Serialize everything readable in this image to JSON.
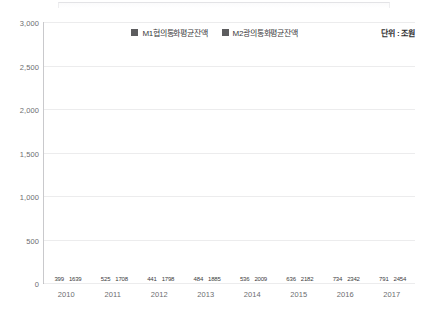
{
  "unit_note": "단위 : 조원",
  "legend": {
    "position": "top-center",
    "items": [
      {
        "label": "M1협의통화평균잔액",
        "color": "#5c5c5e",
        "swatch_icon": "square-swatch-icon"
      },
      {
        "label": "M2광의통화평균잔액",
        "color": "#5c5c5e",
        "swatch_icon": "square-swatch-icon"
      }
    ]
  },
  "axis": {
    "y_ticks": [
      "3,000",
      "2,500",
      "2,000",
      "1,500",
      "1,000",
      "500",
      "0"
    ],
    "x_ticks": [
      "2010",
      "2011",
      "2012",
      "2013",
      "2014",
      "2015",
      "2016",
      "2017"
    ]
  },
  "chart_data": {
    "type": "bar",
    "title": "",
    "subtitle": "",
    "xlabel": "",
    "ylabel": "",
    "unit": "조원",
    "ylim": [
      0,
      3000
    ],
    "ytick_interval": 500,
    "grid": true,
    "legend_position": "top-center",
    "categories": [
      "2010",
      "2011",
      "2012",
      "2013",
      "2014",
      "2015",
      "2016",
      "2017"
    ],
    "series": [
      {
        "name": "M1협의통화평균잔액",
        "color": "#5c5c5e",
        "values": [
          399,
          525,
          441,
          484,
          536,
          636,
          734,
          791
        ],
        "labels": [
          "399",
          "525",
          "441",
          "484",
          "536",
          "636",
          "734",
          "791"
        ]
      },
      {
        "name": "M2광의통화평균잔액",
        "color": "#5c5c5e",
        "values": [
          1639,
          1708,
          1798,
          1885,
          2009,
          2182,
          2342,
          2454
        ],
        "labels": [
          "1639",
          "1708",
          "1798",
          "1885",
          "2009",
          "2182",
          "2342",
          "2454"
        ]
      }
    ]
  }
}
